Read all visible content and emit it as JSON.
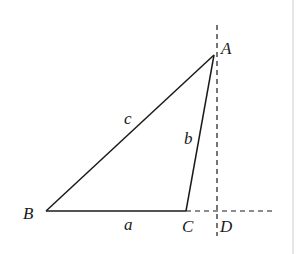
{
  "figure": {
    "type": "triangle-with-altitude",
    "points": {
      "A": {
        "label": "A",
        "x": 214,
        "y": 55
      },
      "B": {
        "label": "B",
        "x": 46,
        "y": 211
      },
      "C": {
        "label": "C",
        "x": 186,
        "y": 211
      },
      "D": {
        "label": "D",
        "x": 217,
        "y": 211
      }
    },
    "sides": {
      "a": {
        "label": "a"
      },
      "b": {
        "label": "b"
      },
      "c": {
        "label": "c"
      }
    },
    "colors": {
      "stroke": "#1a1a1a",
      "dash": "#1a1a1a",
      "border": "#d9d9d9"
    }
  }
}
